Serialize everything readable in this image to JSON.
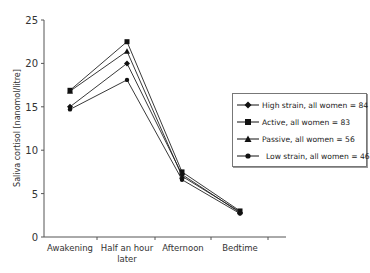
{
  "chart_data": {
    "type": "line",
    "title": "",
    "xlabel": "",
    "ylabel": "Saliva cortisol [nanomol/litre]",
    "ylim": [
      0,
      25
    ],
    "yticks": [
      0,
      5,
      10,
      15,
      20,
      25
    ],
    "grid": false,
    "legend_position": "right",
    "categories": [
      "Awakening",
      "Half an hour later",
      "Afternoon",
      "Bedtime"
    ],
    "category_lines": [
      [
        "Awakening"
      ],
      [
        "Half an hour",
        "later"
      ],
      [
        "Afternoon"
      ],
      [
        "Bedtime"
      ]
    ],
    "series": [
      {
        "name": "High strain, all women = 84",
        "marker": "diamond",
        "values": [
          15.0,
          20.0,
          7.2,
          2.8
        ]
      },
      {
        "name": "Active, all women = 83",
        "marker": "square",
        "values": [
          16.9,
          22.5,
          7.5,
          3.0
        ]
      },
      {
        "name": "Passive, all women = 56",
        "marker": "triangle",
        "values": [
          16.8,
          21.4,
          7.0,
          2.9
        ]
      },
      {
        "name": "Low strain, all women = 46",
        "marker": "circle",
        "values": [
          14.7,
          18.1,
          6.6,
          2.7
        ]
      }
    ]
  },
  "legend": {
    "items": [
      {
        "label": "High strain, all women = 84"
      },
      {
        "label": "Active, all women = 83"
      },
      {
        "label": "Passive, all women = 56"
      },
      {
        "label": "Low strain, all women = 46"
      }
    ]
  }
}
